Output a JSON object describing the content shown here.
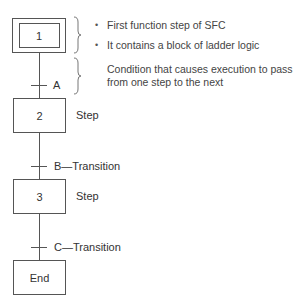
{
  "diagram": {
    "type": "sequential-function-chart",
    "steps": [
      {
        "id": "1",
        "label": "1",
        "initial": true
      },
      {
        "id": "2",
        "label": "2",
        "side_label": "Step"
      },
      {
        "id": "3",
        "label": "3",
        "side_label": "Step"
      },
      {
        "id": "end",
        "label": "End"
      }
    ],
    "transitions": [
      {
        "id": "A",
        "label": "A"
      },
      {
        "id": "B",
        "label": "B—Transition"
      },
      {
        "id": "C",
        "label": "C—Transition"
      }
    ],
    "annotations": {
      "initial_step": [
        "First function step of SFC",
        "It contains a block of ladder logic"
      ],
      "transition_line1": "Condition that causes execution to pass",
      "transition_line2": "from one step to the next",
      "bullet": "•"
    }
  }
}
